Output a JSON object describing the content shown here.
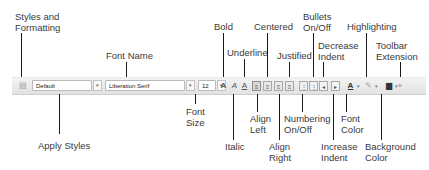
{
  "toolbar": {
    "style_value": "Default",
    "font_name_value": "Liberation Serif",
    "font_size_value": "12",
    "dropdown_arrow": "▾",
    "icons": {
      "styles_formatting": "▤",
      "bold": "A",
      "italic": "A",
      "underline": "A",
      "align_left": "≡",
      "centered": "≡",
      "align_right": "≡",
      "justified": "≡",
      "numbering": "⋮",
      "bullets": "⋮",
      "decrease_indent": "◂",
      "increase_indent": "▸",
      "font_color": "A",
      "highlighting": "✎",
      "background_color": "▆",
      "toolbar_extension": "»"
    }
  },
  "labels": {
    "styles_and_formatting": [
      "Styles and",
      "Formatting"
    ],
    "font_name": "Font Name",
    "bold": "Bold",
    "underline": "Underline",
    "centered": "Centered",
    "justified": "Justified",
    "bullets": [
      "Bullets",
      "On/Off"
    ],
    "decrease_indent": [
      "Decrease",
      "Indent"
    ],
    "highlighting": "Highlighting",
    "toolbar_extension": [
      "Toolbar",
      "Extension"
    ],
    "apply_styles": "Apply Styles",
    "font_size": [
      "Font",
      "Size"
    ],
    "italic": "Italic",
    "align_left": [
      "Align",
      "Left"
    ],
    "align_right": [
      "Align",
      "Right"
    ],
    "numbering": [
      "Numbering",
      "On/Off"
    ],
    "increase_indent": [
      "Increase",
      "Indent"
    ],
    "font_color": [
      "Font",
      "Color"
    ],
    "background_color": [
      "Background",
      "Color"
    ]
  }
}
